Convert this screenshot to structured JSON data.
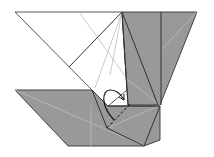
{
  "diagram": {
    "type": "origami-fold-step",
    "colors": {
      "background": "#ffffff",
      "paper_white": "#ffffff",
      "paper_colored": "#999999",
      "edge": "#333333",
      "crease": "#bdbdbd",
      "arrow": "#111111"
    },
    "annotations": {
      "fold_arrow": "curved-arrow",
      "valley_fold": "dashed-line"
    }
  }
}
